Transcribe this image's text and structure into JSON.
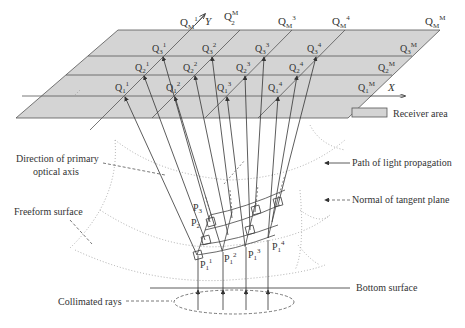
{
  "axes": {
    "x_label": "X",
    "y_label": "Y"
  },
  "top_labels": [
    {
      "base": "Q",
      "sub": "M",
      "sup": "1"
    },
    {
      "base": "Q",
      "sub": "M",
      "sup": "2"
    },
    {
      "base": "Q",
      "sub": "M",
      "sup": "3"
    },
    {
      "base": "Q",
      "sub": "M",
      "sup": "4"
    },
    {
      "base": "Q",
      "sub": "M",
      "sup": "M"
    }
  ],
  "grid_points": {
    "row3": [
      "Q3^1",
      "Q3^2",
      "Q3^3",
      "Q3^4",
      "Q3^M"
    ],
    "row2": [
      "Q2^1",
      "Q2^2",
      "Q2^3",
      "Q2^4",
      "Q2^M"
    ],
    "row1": [
      "Q1^1",
      "Q1^2",
      "Q1^3",
      "Q1^4",
      "Q1^M"
    ]
  },
  "surface_points": [
    "P1^1",
    "P1^2",
    "P1^3",
    "P1^4",
    "P2",
    "P3"
  ],
  "legend": {
    "receiver_area": "Receiver area",
    "light_path": "Path of light propagation",
    "normal": "Normal of tangent plane"
  },
  "annotations": {
    "primary_axis_line1": "Direction of primary",
    "primary_axis_line2": "optical axis",
    "freeform": "Freeform surface",
    "bottom": "Bottom surface",
    "collimated": "Collimated rays"
  },
  "colors": {
    "receiver_fill": "#d4d4d4",
    "line": "#333333",
    "dotted": "#999999"
  }
}
